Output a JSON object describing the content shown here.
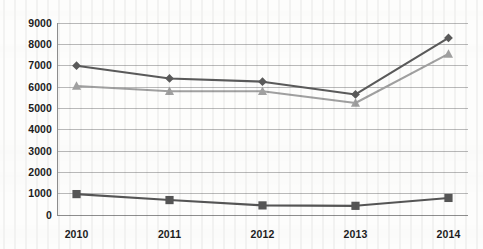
{
  "chart_data": {
    "type": "line",
    "title": "",
    "subtitle": "",
    "xlabel": "",
    "ylabel": "",
    "categories": [
      "2010",
      "2011",
      "2012",
      "2013",
      "2014"
    ],
    "ylim": [
      0,
      9000
    ],
    "ytick_step": 1000,
    "yticks": [
      "9000",
      "8000",
      "7000",
      "6000",
      "5000",
      "4000",
      "3000",
      "2000",
      "1000",
      "0"
    ],
    "grid": "horizontal",
    "legend": "none",
    "series": [
      {
        "name": "series-1",
        "marker": "diamond",
        "color": "#5a5a5a",
        "values": [
          7000,
          6400,
          6250,
          5650,
          8300
        ]
      },
      {
        "name": "series-2",
        "marker": "triangle",
        "color": "#a0a0a0",
        "values": [
          6050,
          5800,
          5800,
          5250,
          7550
        ]
      },
      {
        "name": "series-3",
        "marker": "square",
        "color": "#555555",
        "values": [
          980,
          700,
          450,
          430,
          800
        ]
      }
    ]
  },
  "colors": {
    "background": "#fdfdfc",
    "gridline": "#b9b9b9",
    "axis": "#8d8d8d",
    "tick_text": "#1c1c1c",
    "series_1": "#5a5a5a",
    "series_2": "#a0a0a0",
    "series_3": "#555555"
  },
  "plot_geometry": {
    "left": 57,
    "right": 468,
    "top": 23,
    "bottom": 215
  }
}
